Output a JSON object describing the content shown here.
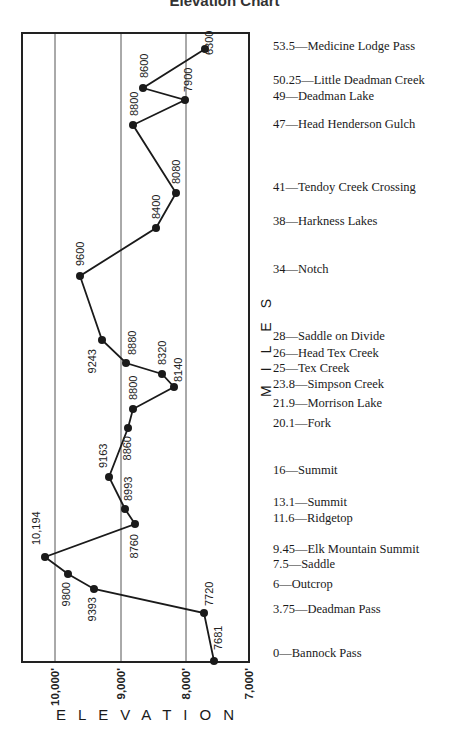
{
  "chart_data": {
    "type": "line",
    "title": "Elevation Chart",
    "orientation": "vertical (miles on y-axis increasing upward, elevation on x-axis decreasing rightward)",
    "xlabel": "ELEVATION",
    "ylabel": "MILES",
    "x_ticks": [
      "10,000'",
      "9,000'",
      "8,000'",
      "7,000'"
    ],
    "x_tick_values": [
      10000,
      9000,
      8000,
      7000
    ],
    "grid": true,
    "points": [
      {
        "mile": 0,
        "place": "Bannock Pass",
        "elevation": 7681,
        "label": "7681"
      },
      {
        "mile": 3.75,
        "place": "Deadman Pass",
        "elevation": 7720,
        "label": "7720"
      },
      {
        "mile": 6,
        "place": "Outcrop",
        "elevation": 9393,
        "label": "9393"
      },
      {
        "mile": 7.5,
        "place": "Saddle",
        "elevation": 9800,
        "label": "9800"
      },
      {
        "mile": 9.45,
        "place": "Elk Mountain Summit",
        "elevation": 10194,
        "label": "10,194"
      },
      {
        "mile": 11.6,
        "place": "Ridgetop",
        "elevation": 8760,
        "label": "8760"
      },
      {
        "mile": 13.1,
        "place": "Summit",
        "elevation": 8993,
        "label": "8993"
      },
      {
        "mile": 16,
        "place": "Summit",
        "elevation": 9163,
        "label": "9163"
      },
      {
        "mile": 20.1,
        "place": "Fork",
        "elevation": 8860,
        "label": "8860"
      },
      {
        "mile": 21.9,
        "place": "Morrison Lake",
        "elevation": 8800,
        "label": "8800"
      },
      {
        "mile": 23.8,
        "place": "Simpson Creek",
        "elevation": 8140,
        "label": "8140"
      },
      {
        "mile": 25,
        "place": "Tex Creek",
        "elevation": 8320,
        "label": "8320"
      },
      {
        "mile": 26,
        "place": "Head Tex Creek",
        "elevation": 8880,
        "label": "8880"
      },
      {
        "mile": 28,
        "place": "Saddle on Divide",
        "elevation": 9243,
        "label": "9243"
      },
      {
        "mile": 34,
        "place": "Notch",
        "elevation": 9600,
        "label": "9600"
      },
      {
        "mile": 38,
        "place": "Harkness Lakes",
        "elevation": 8400,
        "label": "8400"
      },
      {
        "mile": 41,
        "place": "Tendoy Creek Crossing",
        "elevation": 8080,
        "label": "8080"
      },
      {
        "mile": 47,
        "place": "Head Henderson Gulch",
        "elevation": 8800,
        "label": "8800"
      },
      {
        "mile": 49,
        "place": "Deadman Lake",
        "elevation": 7900,
        "label": "7900"
      },
      {
        "mile": 50.25,
        "place": "Little Deadman Creek",
        "elevation": 8600,
        "label": "8600"
      },
      {
        "mile": 53.5,
        "place": "Medicine Lodge Pass",
        "elevation": 6300,
        "label": "6300"
      }
    ]
  },
  "title": "Elevation Chart",
  "axis": {
    "x_label": "ELEVATION",
    "y_label": "MILES",
    "x_ticks": [
      "10,000'",
      "9,000'",
      "8,000'",
      "7,000'"
    ]
  },
  "landmarks": [
    {
      "text": "53.5—Medicine Lodge Pass",
      "y": 46
    },
    {
      "text": "50.25—Little Deadman Creek",
      "y": 80
    },
    {
      "text": "49—Deadman Lake",
      "y": 96
    },
    {
      "text": "47—Head Henderson Gulch",
      "y": 124
    },
    {
      "text": "41—Tendoy Creek Crossing",
      "y": 187
    },
    {
      "text": "38—Harkness Lakes",
      "y": 221
    },
    {
      "text": "34—Notch",
      "y": 269
    },
    {
      "text": "28—Saddle on Divide",
      "y": 336
    },
    {
      "text": "26—Head Tex Creek",
      "y": 353
    },
    {
      "text": "25—Tex Creek",
      "y": 368
    },
    {
      "text": "23.8—Simpson Creek",
      "y": 384
    },
    {
      "text": "21.9—Morrison Lake",
      "y": 403
    },
    {
      "text": "20.1—Fork",
      "y": 423
    },
    {
      "text": "16—Summit",
      "y": 470
    },
    {
      "text": "13.1—Summit",
      "y": 502
    },
    {
      "text": "11.6—Ridgetop",
      "y": 518
    },
    {
      "text": "9.45—Elk Mountain Summit",
      "y": 549
    },
    {
      "text": "7.5—Saddle",
      "y": 564
    },
    {
      "text": "6—Outcrop",
      "y": 584
    },
    {
      "text": "3.75—Deadman Pass",
      "y": 609
    },
    {
      "text": "0—Bannock Pass",
      "y": 653
    }
  ],
  "plot_points": [
    {
      "x": 214,
      "y": 661,
      "label": "7681",
      "lx": 222,
      "ly": 650,
      "anchor": "start"
    },
    {
      "x": 204,
      "y": 613,
      "label": "7720",
      "lx": 213,
      "ly": 606,
      "anchor": "start"
    },
    {
      "x": 94,
      "y": 589,
      "label": "9393",
      "lx": 96,
      "ly": 597,
      "anchor": "end"
    },
    {
      "x": 68,
      "y": 574,
      "label": "9800",
      "lx": 70,
      "ly": 582,
      "anchor": "end"
    },
    {
      "x": 45,
      "y": 557,
      "label": "10,194",
      "lx": 40,
      "ly": 545,
      "anchor": "start"
    },
    {
      "x": 135,
      "y": 524,
      "label": "8760",
      "lx": 138,
      "ly": 534,
      "anchor": "end"
    },
    {
      "x": 125,
      "y": 509,
      "label": "8993",
      "lx": 132,
      "ly": 501,
      "anchor": "start"
    },
    {
      "x": 109,
      "y": 477,
      "label": "9163",
      "lx": 107,
      "ly": 468,
      "anchor": "start"
    },
    {
      "x": 128,
      "y": 428,
      "label": "8860",
      "lx": 131,
      "ly": 436,
      "anchor": "end"
    },
    {
      "x": 133,
      "y": 409,
      "label": "8800",
      "lx": 137,
      "ly": 400,
      "anchor": "start"
    },
    {
      "x": 174,
      "y": 387,
      "label": "8140",
      "lx": 182,
      "ly": 382,
      "anchor": "start"
    },
    {
      "x": 162,
      "y": 374,
      "label": "8320",
      "lx": 166,
      "ly": 365,
      "anchor": "start"
    },
    {
      "x": 126,
      "y": 363,
      "label": "8880",
      "lx": 136,
      "ly": 355,
      "anchor": "start"
    },
    {
      "x": 102,
      "y": 340,
      "label": "9243",
      "lx": 96,
      "ly": 349,
      "anchor": "end"
    },
    {
      "x": 80,
      "y": 276,
      "label": "9600",
      "lx": 84,
      "ly": 266,
      "anchor": "start"
    },
    {
      "x": 156,
      "y": 228,
      "label": "8400",
      "lx": 160,
      "ly": 219,
      "anchor": "start"
    },
    {
      "x": 176,
      "y": 193,
      "label": "8080",
      "lx": 180,
      "ly": 184,
      "anchor": "start"
    },
    {
      "x": 133,
      "y": 125,
      "label": "8800",
      "lx": 138,
      "ly": 116,
      "anchor": "start"
    },
    {
      "x": 185,
      "y": 100,
      "label": "7900",
      "lx": 192,
      "ly": 92,
      "anchor": "start"
    },
    {
      "x": 143,
      "y": 88,
      "label": "8600",
      "lx": 148,
      "ly": 78,
      "anchor": "start"
    },
    {
      "x": 205,
      "y": 49,
      "label": "6300",
      "lx": 213,
      "ly": 55,
      "anchor": "start"
    }
  ],
  "colors": {
    "line": "#1a1a1a",
    "grid": "#555555",
    "frame": "#222222"
  }
}
